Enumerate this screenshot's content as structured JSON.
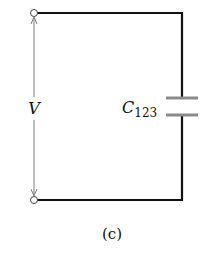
{
  "diagram": {
    "type": "circuit",
    "caption": "(c)",
    "voltage_label": "V",
    "capacitor": {
      "label_main": "C",
      "label_sub": "123"
    },
    "colors": {
      "wire": "#111111",
      "arrow": "#777777",
      "plate": "#888888",
      "terminal_fill": "#ffffff"
    },
    "components": [
      {
        "kind": "terminal",
        "position": "top-left"
      },
      {
        "kind": "terminal",
        "position": "bottom-left"
      },
      {
        "kind": "capacitor",
        "label": "C123",
        "position": "right-branch"
      },
      {
        "kind": "voltage-arrow",
        "label": "V",
        "position": "between-terminals"
      }
    ]
  }
}
